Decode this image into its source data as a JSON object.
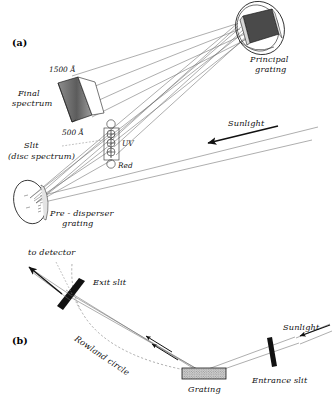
{
  "figure": {
    "background": "#ffffff",
    "width": 333,
    "height": 400
  },
  "panels": [
    {
      "id": "a",
      "label": "(a)",
      "caption": "Double-dispersion layout with pre-disperser and principal grating"
    },
    {
      "id": "b",
      "label": "(b)",
      "caption": "Rowland circle mounting with entrance and exit slits"
    }
  ],
  "panel_a": {
    "labels": {
      "principal_grating": "Principal",
      "principal_grating_2": "grating",
      "final_spectrum": "Final",
      "final_spectrum_2": "spectrum",
      "wavelength_top": "1500 Å",
      "wavelength_bottom": "500 Å",
      "slit": "Slit",
      "slit_sub": "(disc spectrum)",
      "uv": "UV",
      "red": "Red",
      "sunlight": "Sunlight",
      "predisperser": "Pre - disperser",
      "predisperser_2": "grating"
    },
    "components": [
      {
        "name": "principal-grating",
        "type": "circular-grating-disc"
      },
      {
        "name": "pre-disperser-grating",
        "type": "circular-grating-disc"
      },
      {
        "name": "final-spectrum",
        "type": "spectrum-wedge"
      },
      {
        "name": "slit-assembly",
        "type": "slit-with-orders"
      }
    ],
    "spectral_orders": [
      "UV",
      "Red"
    ]
  },
  "panel_b": {
    "labels": {
      "to_detector": "to detector",
      "exit_slit": "Exit slit",
      "rowland_circle": "Rowland circle",
      "grating": "Grating",
      "entrance_slit": "Entrance slit",
      "sunlight": "Sunlight"
    },
    "components": [
      {
        "name": "entrance-slit",
        "type": "slit-bar"
      },
      {
        "name": "exit-slit",
        "type": "slit-bar"
      },
      {
        "name": "grating",
        "type": "hatched-rectangle"
      },
      {
        "name": "rowland-circle",
        "type": "dashed-arc"
      }
    ]
  },
  "colors": {
    "ink": "#111111",
    "ray": "#6b6b6b",
    "ray_dark": "#2b2b2b",
    "grating_face": "#4a4a4a",
    "grating_fill": "#c9c9c9",
    "spectrum_shade": "#5a5a5a",
    "background": "#ffffff"
  }
}
